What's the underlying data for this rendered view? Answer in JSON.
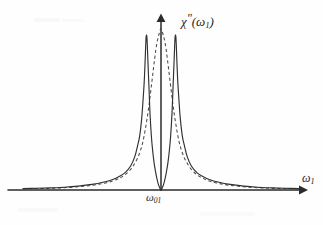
{
  "figure": {
    "background_color": "#fefefe",
    "ink_color": "#303030",
    "y_axis_label": "χ″(ω₁)",
    "x_axis_label": "ω₁",
    "center_tick_label": "ω₀₁",
    "y_label_base": "χ",
    "y_label_prime": "″",
    "y_label_arg_open": "(",
    "y_label_arg_omega": "ω",
    "y_label_arg_sub": "1",
    "y_label_arg_close": ")",
    "x_label_omega": "ω",
    "x_label_sub": "1",
    "center_tick_omega": "ω",
    "center_tick_sub": "01"
  },
  "chart_data": {
    "type": "line",
    "title": "",
    "xlabel": "ω₁",
    "ylabel": "χ″(ω₁)",
    "grid": false,
    "legend": "none",
    "xlim": [
      -1.0,
      1.0
    ],
    "ylim": [
      0,
      1.05
    ],
    "xticks": [
      0
    ],
    "xticklabels": [
      "ω₀₁"
    ],
    "yticks": [],
    "yticklabels": [],
    "annotations": [
      {
        "text": "χ″(ω₁)",
        "position": "above y-axis arrow tip",
        "style": "italic"
      },
      {
        "text": "ω₁",
        "position": "above right end of x-axis arrow",
        "style": "italic"
      },
      {
        "text": "ω₀₁",
        "position": "below origin on x-axis",
        "style": "italic"
      }
    ],
    "axis_style": {
      "x_axis": "arrow pointing right",
      "y_axis": "arrow pointing up",
      "origin_x_px": 161,
      "baseline_y_px": 190,
      "spines": "arrows only, no box"
    },
    "series": [
      {
        "name": "solid",
        "style": "solid",
        "color": "#303030",
        "description": "Autler-Townes doublet: two sharp Lorentzian peaks split symmetrically about ω₀₁ with a deep null at line center",
        "peak_centers": [
          -0.105,
          0.105
        ],
        "peak_halfwidth": 0.03,
        "peak_value": 1.0,
        "center_value": 0.0,
        "x": [
          -1.0,
          -0.9,
          -0.8,
          -0.7,
          -0.6,
          -0.5,
          -0.42,
          -0.35,
          -0.3,
          -0.26,
          -0.22,
          -0.19,
          -0.17,
          -0.155,
          -0.14,
          -0.13,
          -0.122,
          -0.116,
          -0.111,
          -0.108,
          -0.105,
          -0.102,
          -0.099,
          -0.094,
          -0.088,
          -0.08,
          -0.07,
          -0.06,
          -0.05,
          -0.04,
          -0.03,
          -0.02,
          -0.012,
          -0.006,
          -0.002,
          0.0,
          0.002,
          0.006,
          0.012,
          0.02,
          0.03,
          0.04,
          0.05,
          0.06,
          0.07,
          0.08,
          0.088,
          0.094,
          0.099,
          0.102,
          0.105,
          0.108,
          0.111,
          0.116,
          0.122,
          0.13,
          0.14,
          0.155,
          0.17,
          0.19,
          0.22,
          0.26,
          0.3,
          0.35,
          0.42,
          0.5,
          0.6,
          0.7,
          0.8,
          0.9,
          1.0
        ],
        "y": [
          0.009,
          0.011,
          0.014,
          0.018,
          0.025,
          0.036,
          0.05,
          0.068,
          0.089,
          0.112,
          0.155,
          0.215,
          0.285,
          0.345,
          0.46,
          0.58,
          0.69,
          0.81,
          0.93,
          0.985,
          1.0,
          0.985,
          0.93,
          0.81,
          0.68,
          0.5,
          0.35,
          0.25,
          0.175,
          0.12,
          0.075,
          0.04,
          0.02,
          0.007,
          0.001,
          0.0,
          0.001,
          0.007,
          0.02,
          0.04,
          0.075,
          0.12,
          0.175,
          0.25,
          0.35,
          0.5,
          0.68,
          0.81,
          0.93,
          0.985,
          1.0,
          0.985,
          0.93,
          0.81,
          0.69,
          0.58,
          0.46,
          0.345,
          0.285,
          0.215,
          0.155,
          0.112,
          0.089,
          0.068,
          0.05,
          0.036,
          0.025,
          0.018,
          0.014,
          0.011,
          0.009
        ]
      },
      {
        "name": "dashed",
        "style": "dashed",
        "color": "#4a4a4a",
        "description": "Single unsplit Lorentzian absorption line centered at ω₀₁, slightly taller and narrower than the doublet envelope",
        "peak_center": 0.0,
        "peak_halfwidth": 0.085,
        "peak_value": 1.04,
        "x": [
          -1.0,
          -0.9,
          -0.8,
          -0.7,
          -0.6,
          -0.5,
          -0.42,
          -0.35,
          -0.3,
          -0.26,
          -0.22,
          -0.19,
          -0.165,
          -0.145,
          -0.13,
          -0.115,
          -0.1,
          -0.088,
          -0.076,
          -0.065,
          -0.055,
          -0.046,
          -0.038,
          -0.03,
          -0.023,
          -0.017,
          -0.011,
          -0.006,
          -0.002,
          0.0,
          0.002,
          0.006,
          0.011,
          0.017,
          0.023,
          0.03,
          0.038,
          0.046,
          0.055,
          0.065,
          0.076,
          0.088,
          0.1,
          0.115,
          0.13,
          0.145,
          0.165,
          0.19,
          0.22,
          0.26,
          0.3,
          0.35,
          0.42,
          0.5,
          0.6,
          0.7,
          0.8,
          0.9,
          1.0
        ],
        "y": [
          0.007,
          0.009,
          0.011,
          0.015,
          0.021,
          0.03,
          0.042,
          0.058,
          0.077,
          0.098,
          0.132,
          0.172,
          0.215,
          0.265,
          0.315,
          0.385,
          0.465,
          0.54,
          0.625,
          0.705,
          0.78,
          0.845,
          0.9,
          0.945,
          0.975,
          0.995,
          1.015,
          1.03,
          1.038,
          1.04,
          1.038,
          1.03,
          1.015,
          0.995,
          0.975,
          0.945,
          0.9,
          0.845,
          0.78,
          0.705,
          0.625,
          0.54,
          0.465,
          0.385,
          0.315,
          0.265,
          0.215,
          0.172,
          0.132,
          0.098,
          0.077,
          0.058,
          0.042,
          0.03,
          0.021,
          0.015,
          0.011,
          0.009,
          0.007
        ]
      }
    ]
  }
}
